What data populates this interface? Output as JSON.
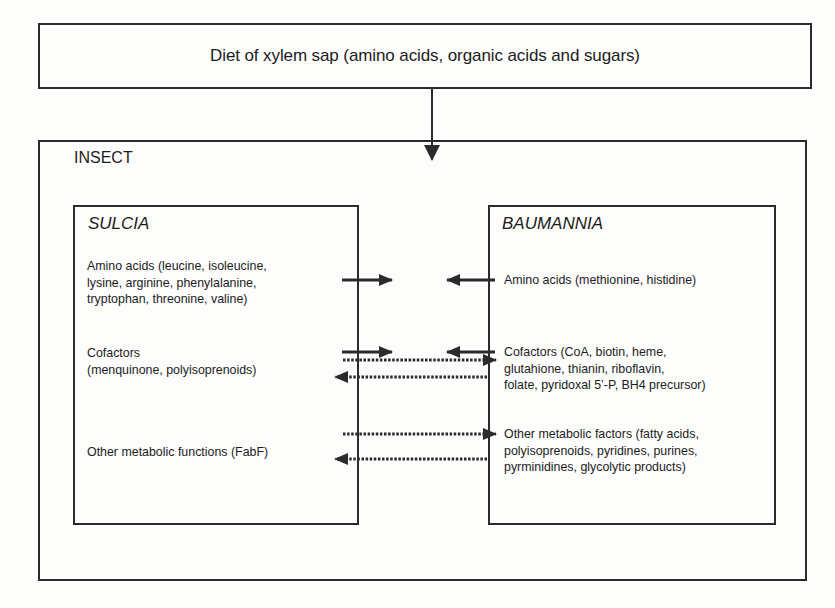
{
  "diet": {
    "label": "Diet of xylem sap (amino acids, organic acids and sugars)"
  },
  "insect": {
    "label": "INSECT"
  },
  "sulcia": {
    "title": "SULCIA",
    "items": [
      {
        "line1": "Amino acids (leucine, isoleucine,",
        "line2": "lysine, arginine, phenylalanine,",
        "line3": "tryptophan, threonine, valine)"
      },
      {
        "line1": "Cofactors",
        "line2": "(menquinone, polyisoprenoids)"
      },
      {
        "line1": "Other metabolic functions (FabF)"
      }
    ]
  },
  "baumannia": {
    "title": "BAUMANNIA",
    "items": [
      {
        "line1": "Amino acids (methionine, histidine)"
      },
      {
        "line1": "Cofactors (CoA, biotin, heme,",
        "line2": "glutahione, thianin, riboflavin,",
        "line3": "folate, pyridoxal 5’-P, BH4 precursor)"
      },
      {
        "line1": "Other metabolic factors (fatty acids,",
        "line2": "polyisoprenoids, pyridines, purines,",
        "line3": "pyrminidines, glycolytic products)"
      }
    ]
  },
  "arrows": [
    {
      "id": "diet-to-insect",
      "style": "solid",
      "direction": "down"
    },
    {
      "id": "sulcia-amino-out",
      "style": "solid",
      "direction": "right"
    },
    {
      "id": "baumannia-amino-out",
      "style": "solid",
      "direction": "left"
    },
    {
      "id": "sulcia-cofactor-out",
      "style": "solid",
      "direction": "right"
    },
    {
      "id": "baumannia-cofactor-out",
      "style": "solid",
      "direction": "left"
    },
    {
      "id": "cofactor-to-baumannia",
      "style": "dotted",
      "direction": "right"
    },
    {
      "id": "cofactor-to-sulcia",
      "style": "dotted",
      "direction": "left"
    },
    {
      "id": "metabolic-to-baumannia",
      "style": "dotted",
      "direction": "right"
    },
    {
      "id": "metabolic-to-sulcia",
      "style": "dotted",
      "direction": "left"
    }
  ],
  "colors": {
    "line": "#2b2b2b",
    "background": "#fdfdfc"
  }
}
